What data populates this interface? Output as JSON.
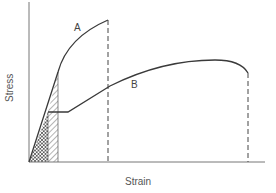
{
  "diagram": {
    "type": "stress-strain curve comparison",
    "xlabel": "Strain",
    "ylabel": "Stress",
    "curves": [
      {
        "label": "A",
        "description": "higher strength, lower ductility; fractures at low strain (dashed drop line)"
      },
      {
        "label": "B",
        "description": "lower strength with yield plateau, high ductility; fractures at large strain (dashed drop line)"
      }
    ],
    "regions": [
      {
        "name": "cross-hatched",
        "description": "elastic region area under both curves (resilience of B)"
      },
      {
        "name": "diagonal-hatched",
        "description": "additional elastic area under curve A"
      }
    ],
    "colors": {
      "line": "#3a3a3a",
      "axis": "#777777",
      "text": "#555555"
    }
  }
}
